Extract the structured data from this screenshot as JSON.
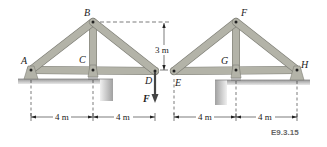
{
  "figure_id": "E9.3.15",
  "colors": {
    "member": "#b3b3a8",
    "member_stroke": "#7d7d75",
    "ground": "#a8a8a8",
    "ground_light": "#dcdcdc",
    "line": "#222222"
  },
  "left_truss": {
    "joints": {
      "A": "A",
      "B": "B",
      "C": "C",
      "D": "D"
    },
    "load_label": "F",
    "height_label": "3 m",
    "spans": [
      "4 m",
      "4 m"
    ]
  },
  "right_truss": {
    "joints": {
      "E": "E",
      "F": "F",
      "G": "G",
      "H": "H"
    },
    "spans": [
      "4 m",
      "4 m"
    ]
  }
}
